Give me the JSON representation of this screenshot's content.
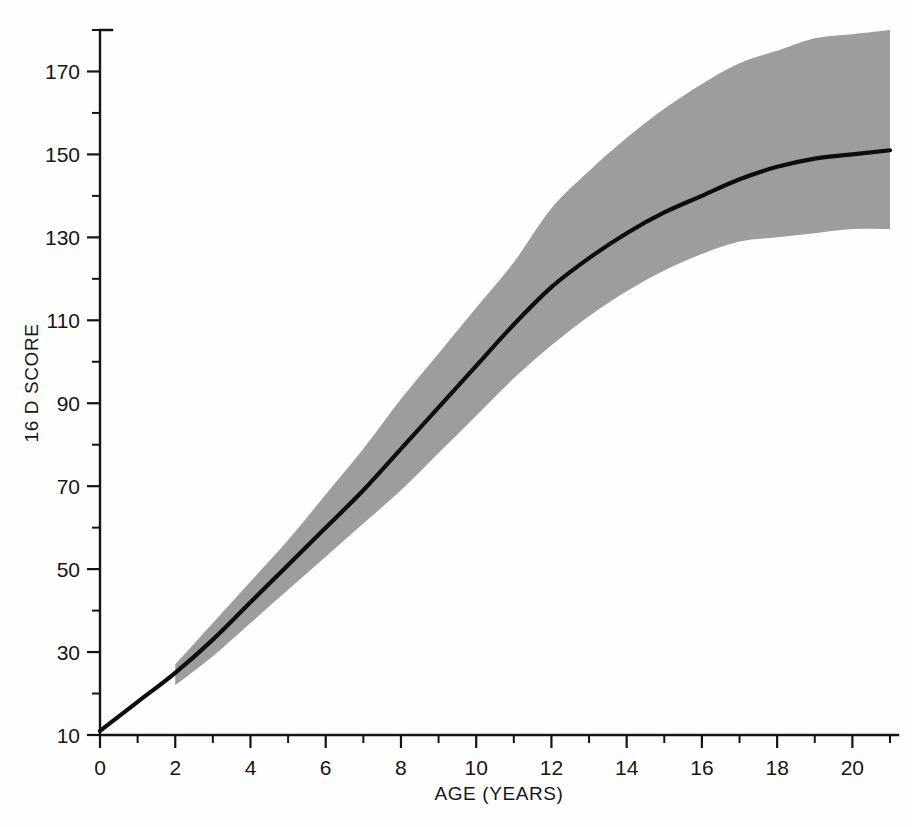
{
  "figure": {
    "background_color": "#ffffff",
    "line_color": "#0d0d0d",
    "band_color": "#9d9d9d",
    "axis_color": "#141414"
  },
  "axes": {
    "y_title": "16 D SCORE",
    "x_title": "AGE (YEARS)",
    "y_ticks": [
      "170",
      "150",
      "130",
      "110",
      "90",
      "70",
      "50",
      "30",
      "10"
    ],
    "y_tick_values": [
      170,
      150,
      130,
      110,
      90,
      70,
      50,
      30,
      10
    ],
    "y_minor_tick_values": [
      180,
      160,
      140,
      120,
      100,
      80,
      60,
      40,
      20
    ],
    "x_ticks": [
      "0",
      "2",
      "4",
      "6",
      "8",
      "10",
      "12",
      "14",
      "16",
      "18",
      "20"
    ],
    "x_tick_values": [
      0,
      2,
      4,
      6,
      8,
      10,
      12,
      14,
      16,
      18,
      20
    ],
    "x_minor_tick_values": [
      1,
      3,
      5,
      7,
      9,
      11,
      13,
      15,
      17,
      19,
      21
    ]
  },
  "chart_data": {
    "type": "line",
    "title": "",
    "subtitle": "",
    "xlabel": "AGE (YEARS)",
    "ylabel": "16 D SCORE",
    "xlim": [
      0,
      21
    ],
    "ylim": [
      10,
      180
    ],
    "grid": false,
    "legend": "none",
    "annotations": [],
    "x": [
      0,
      1,
      2,
      3,
      4,
      5,
      6,
      7,
      8,
      9,
      10,
      11,
      12,
      13,
      14,
      15,
      16,
      17,
      18,
      19,
      20,
      21
    ],
    "series": [
      {
        "name": "Mean 16 D score",
        "style": "solid-black-line",
        "values": [
          11,
          18,
          25,
          33,
          42,
          51,
          60,
          69,
          79,
          89,
          99,
          109,
          118,
          125,
          131,
          136,
          140,
          144,
          147,
          149,
          150,
          151
        ]
      },
      {
        "name": "Upper band limit",
        "style": "shaded-region-upper",
        "x_start": 2,
        "values": [
          null,
          null,
          27,
          37,
          47,
          57,
          68,
          79,
          91,
          102,
          113,
          124,
          137,
          146,
          154,
          161,
          167,
          172,
          175,
          178,
          179,
          180
        ]
      },
      {
        "name": "Lower band limit",
        "style": "shaded-region-lower",
        "x_start": 2,
        "values": [
          null,
          null,
          22,
          29,
          37,
          45,
          53,
          61,
          69,
          78,
          87,
          96,
          104,
          111,
          117,
          122,
          126,
          129,
          130,
          131,
          132,
          132
        ]
      }
    ],
    "band_note": "Shaded region spans the range between the upper and lower limits, beginning at age 2 years."
  }
}
